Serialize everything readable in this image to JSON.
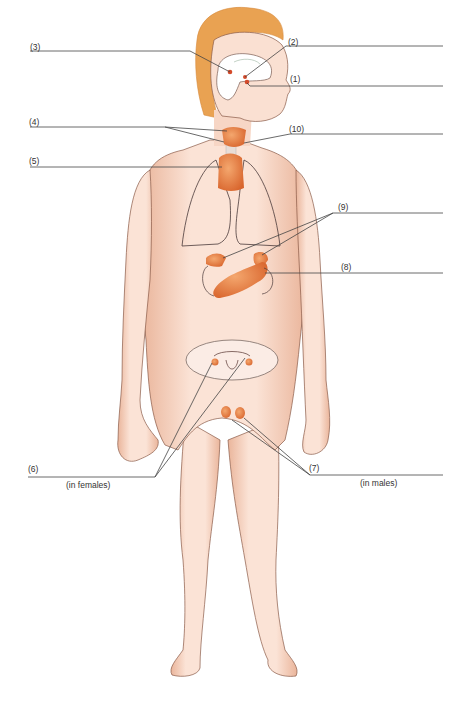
{
  "figure": {
    "caption_visible": "cropped at bottom edge",
    "colors": {
      "skin": "#f6d6c4",
      "skin_shadow": "#e8a88a",
      "hair": "#e9a252",
      "gland": "#e07a3e",
      "leader_line": "#444444",
      "outline": "#555555",
      "background": "#ffffff"
    }
  },
  "labels": [
    {
      "id": "1",
      "text": "(1)",
      "x": 290,
      "y": 75
    },
    {
      "id": "2",
      "text": "(2)",
      "x": 288,
      "y": 38
    },
    {
      "id": "3",
      "text": "(3)",
      "x": 30,
      "y": 43
    },
    {
      "id": "4",
      "text": "(4)",
      "x": 29,
      "y": 118
    },
    {
      "id": "5",
      "text": "(5)",
      "x": 29,
      "y": 157
    },
    {
      "id": "6",
      "text": "(6)",
      "x": 28,
      "y": 465
    },
    {
      "id": "6-note",
      "text": "(in females)",
      "x": 66,
      "y": 481
    },
    {
      "id": "7",
      "text": "(7)",
      "x": 309,
      "y": 464
    },
    {
      "id": "7-note",
      "text": "(in males)",
      "x": 360,
      "y": 479
    },
    {
      "id": "8",
      "text": "(8)",
      "x": 341,
      "y": 263
    },
    {
      "id": "9",
      "text": "(9)",
      "x": 338,
      "y": 203
    },
    {
      "id": "10",
      "text": "(10)",
      "x": 289,
      "y": 125
    }
  ],
  "leader_lines": [
    {
      "id": "1",
      "points": "443,86 250,86 247,83"
    },
    {
      "id": "2",
      "points": "443,46 286,46 245,77"
    },
    {
      "id": "3",
      "points": "30,51 190,51 230,72"
    },
    {
      "id": "4a",
      "points": "30,127 165,127 227,131"
    },
    {
      "id": "4b",
      "points": "165,127 224,142"
    },
    {
      "id": "5",
      "points": "30,167 222,167"
    },
    {
      "id": "6a",
      "points": "28,477 155,477 212,363"
    },
    {
      "id": "6b",
      "points": "155,477 245,358"
    },
    {
      "id": "7a",
      "points": "443,475 310,475 232,420"
    },
    {
      "id": "7b",
      "points": "310,475 244,418"
    },
    {
      "id": "8",
      "points": "443,273 265,273"
    },
    {
      "id": "9a",
      "points": "443,213 333,213 223,258"
    },
    {
      "id": "9b",
      "points": "333,213 262,255"
    },
    {
      "id": "10",
      "points": "443,134 290,134 244,143"
    }
  ]
}
